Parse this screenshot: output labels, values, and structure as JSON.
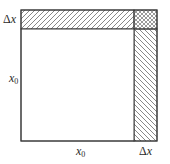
{
  "diagram": {
    "title": "",
    "labels": {
      "top_strip_width": "Δx",
      "left_side": "x",
      "left_side_sub": "0",
      "bottom_side": "x",
      "bottom_side_sub": "0",
      "right_strip_width": "Δx",
      "delta_symbol": "Δ",
      "x_symbol": "x"
    },
    "regions": [
      {
        "name": "main-square",
        "side": "x0",
        "fill": "none"
      },
      {
        "name": "top-strip",
        "dims": "x0 × Δx",
        "fill": "diagonal-hatch-forward"
      },
      {
        "name": "right-strip",
        "dims": "Δx × x0",
        "fill": "diagonal-hatch-backward"
      },
      {
        "name": "corner-square",
        "dims": "Δx × Δx",
        "fill": "cross-hatch"
      }
    ],
    "colors": {
      "stroke": "#3a3a3a",
      "hatch": "#555555",
      "background": "#ffffff"
    }
  }
}
